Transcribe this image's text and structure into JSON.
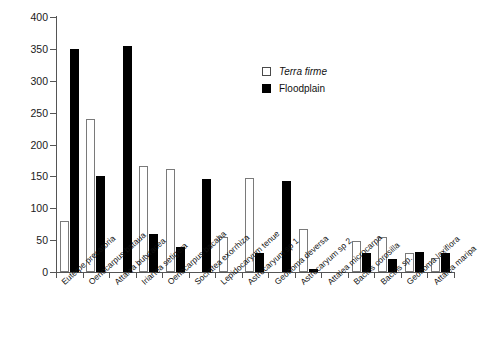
{
  "chart_data": {
    "type": "bar",
    "title": "",
    "subtitle": "",
    "xlabel": "",
    "ylabel": "",
    "ylim": [
      0,
      400
    ],
    "yticks": [
      0,
      50,
      100,
      150,
      200,
      250,
      300,
      350,
      400
    ],
    "grid": false,
    "legend_position": "upper-right-inside",
    "categories": [
      "Euterpe precatoria",
      "Oenocarpus bataua",
      "Attalea butyracea",
      "Iriartea setigera",
      "Oenocarpus bacaba",
      "Socratea exorrhiza",
      "Lepidocaryum tenue",
      "Astrocaryum sp 1",
      "Geonoma deversa",
      "Astrocaryum sp 2",
      "Attalea microcarpa",
      "Bactris corosilla",
      "Bactris sp.",
      "Geonoma laxiflora",
      "Attalea maripa"
    ],
    "series": [
      {
        "name": "Terra firme",
        "style": "open",
        "color": "#ffffff",
        "edge_color": "#7a7a7a",
        "values": [
          80,
          240,
          0,
          166,
          161,
          0,
          55,
          147,
          0,
          67,
          0,
          48,
          55,
          30,
          22
        ]
      },
      {
        "name": "Floodplain",
        "style": "filled",
        "color": "#000000",
        "edge_color": "#000000",
        "values": [
          350,
          150,
          355,
          60,
          40,
          146,
          0,
          30,
          142,
          5,
          0,
          30,
          20,
          32,
          30
        ]
      }
    ]
  },
  "legend": {
    "items": [
      {
        "label": "Terra firme",
        "style": "terra",
        "italic": true
      },
      {
        "label": "Floodplain",
        "style": "flood",
        "italic": false
      }
    ]
  },
  "axis": {
    "y_tick_labels": [
      "400",
      "350",
      "300",
      "250",
      "200",
      "150",
      "100",
      "50",
      "0"
    ]
  }
}
